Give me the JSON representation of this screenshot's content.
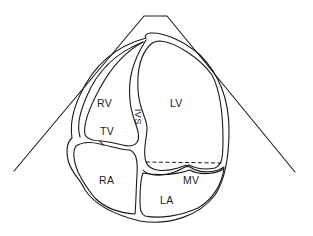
{
  "diagram": {
    "type": "echocardiogram-apical-four-chamber-schematic",
    "colors": {
      "stroke": "#1a1a1a",
      "background": "#ffffff"
    },
    "labels": {
      "rv": "RV",
      "lv": "LV",
      "ivs": "IVS",
      "tv": "TV",
      "ra": "RA",
      "mv": "MV",
      "la": "LA"
    }
  }
}
